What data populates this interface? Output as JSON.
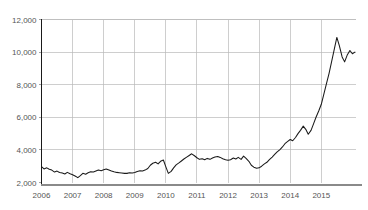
{
  "chart_data": {
    "type": "line",
    "title": "",
    "subtitle": "",
    "xlabel": "",
    "ylabel": "",
    "xlim": [
      2006.0,
      2016.1
    ],
    "ylim": [
      2000,
      12000
    ],
    "grid": true,
    "legend": false,
    "legend_position": "none",
    "line_color": "#1a1a1a",
    "grid_color": "#b9b9b9",
    "axis_color": "#8a8a8a",
    "y_ticks": [
      2000,
      4000,
      6000,
      8000,
      10000,
      12000
    ],
    "y_tick_labels": [
      "2,000",
      "4,000",
      "6,000",
      "8,000",
      "10,000",
      "12,000"
    ],
    "x_ticks": [
      2006,
      2007,
      2008,
      2009,
      2010,
      2011,
      2012,
      2013,
      2014,
      2015
    ],
    "x_tick_labels": [
      "2006",
      "2007",
      "2008",
      "2009",
      "2010",
      "2011",
      "2012",
      "2013",
      "2014",
      "2015"
    ],
    "series": [
      {
        "name": "index",
        "x": [
          2006.0,
          2006.08,
          2006.17,
          2006.25,
          2006.33,
          2006.42,
          2006.5,
          2006.58,
          2006.67,
          2006.75,
          2006.83,
          2006.92,
          2007.0,
          2007.08,
          2007.17,
          2007.25,
          2007.33,
          2007.42,
          2007.5,
          2007.58,
          2007.67,
          2007.75,
          2007.83,
          2007.92,
          2008.0,
          2008.08,
          2008.17,
          2008.25,
          2008.33,
          2008.42,
          2008.5,
          2008.58,
          2008.67,
          2008.75,
          2008.83,
          2008.92,
          2009.0,
          2009.08,
          2009.17,
          2009.25,
          2009.33,
          2009.42,
          2009.5,
          2009.58,
          2009.67,
          2009.75,
          2009.83,
          2009.92,
          2010.0,
          2010.08,
          2010.17,
          2010.25,
          2010.33,
          2010.42,
          2010.5,
          2010.58,
          2010.67,
          2010.75,
          2010.83,
          2010.92,
          2011.0,
          2011.08,
          2011.17,
          2011.25,
          2011.33,
          2011.42,
          2011.5,
          2011.58,
          2011.67,
          2011.75,
          2011.83,
          2011.92,
          2012.0,
          2012.08,
          2012.17,
          2012.25,
          2012.33,
          2012.42,
          2012.5,
          2012.58,
          2012.67,
          2012.75,
          2012.83,
          2012.92,
          2013.0,
          2013.08,
          2013.17,
          2013.25,
          2013.33,
          2013.42,
          2013.5,
          2013.58,
          2013.67,
          2013.75,
          2013.83,
          2013.92,
          2014.0,
          2014.08,
          2014.17,
          2014.25,
          2014.33,
          2014.42,
          2014.5,
          2014.58,
          2014.67,
          2014.75,
          2014.83,
          2014.92,
          2015.0,
          2015.08,
          2015.17,
          2015.25,
          2015.33,
          2015.42,
          2015.5,
          2015.58,
          2015.67,
          2015.75,
          2015.83,
          2015.92,
          2016.0,
          2016.08
        ],
        "values": [
          2980,
          2830,
          2900,
          2810,
          2760,
          2640,
          2700,
          2610,
          2580,
          2520,
          2620,
          2540,
          2480,
          2400,
          2300,
          2420,
          2560,
          2510,
          2600,
          2660,
          2640,
          2700,
          2760,
          2720,
          2780,
          2830,
          2760,
          2700,
          2660,
          2620,
          2600,
          2580,
          2560,
          2560,
          2600,
          2580,
          2620,
          2680,
          2720,
          2700,
          2760,
          2860,
          3060,
          3180,
          3240,
          3140,
          3300,
          3380,
          2960,
          2560,
          2680,
          2900,
          3080,
          3200,
          3320,
          3440,
          3560,
          3660,
          3760,
          3640,
          3520,
          3420,
          3460,
          3400,
          3480,
          3420,
          3500,
          3560,
          3600,
          3540,
          3460,
          3400,
          3360,
          3400,
          3500,
          3440,
          3540,
          3420,
          3620,
          3480,
          3300,
          3060,
          2940,
          2880,
          2900,
          3000,
          3140,
          3240,
          3400,
          3560,
          3720,
          3880,
          4020,
          4180,
          4380,
          4520,
          4640,
          4560,
          4760,
          5000,
          5200,
          5460,
          5260,
          4960,
          5200,
          5600,
          6000,
          6400,
          6800,
          7400,
          8100,
          8700,
          9400,
          10200,
          10900,
          10400,
          9700,
          9400,
          9800,
          10100,
          9900,
          10000
        ]
      }
    ]
  }
}
